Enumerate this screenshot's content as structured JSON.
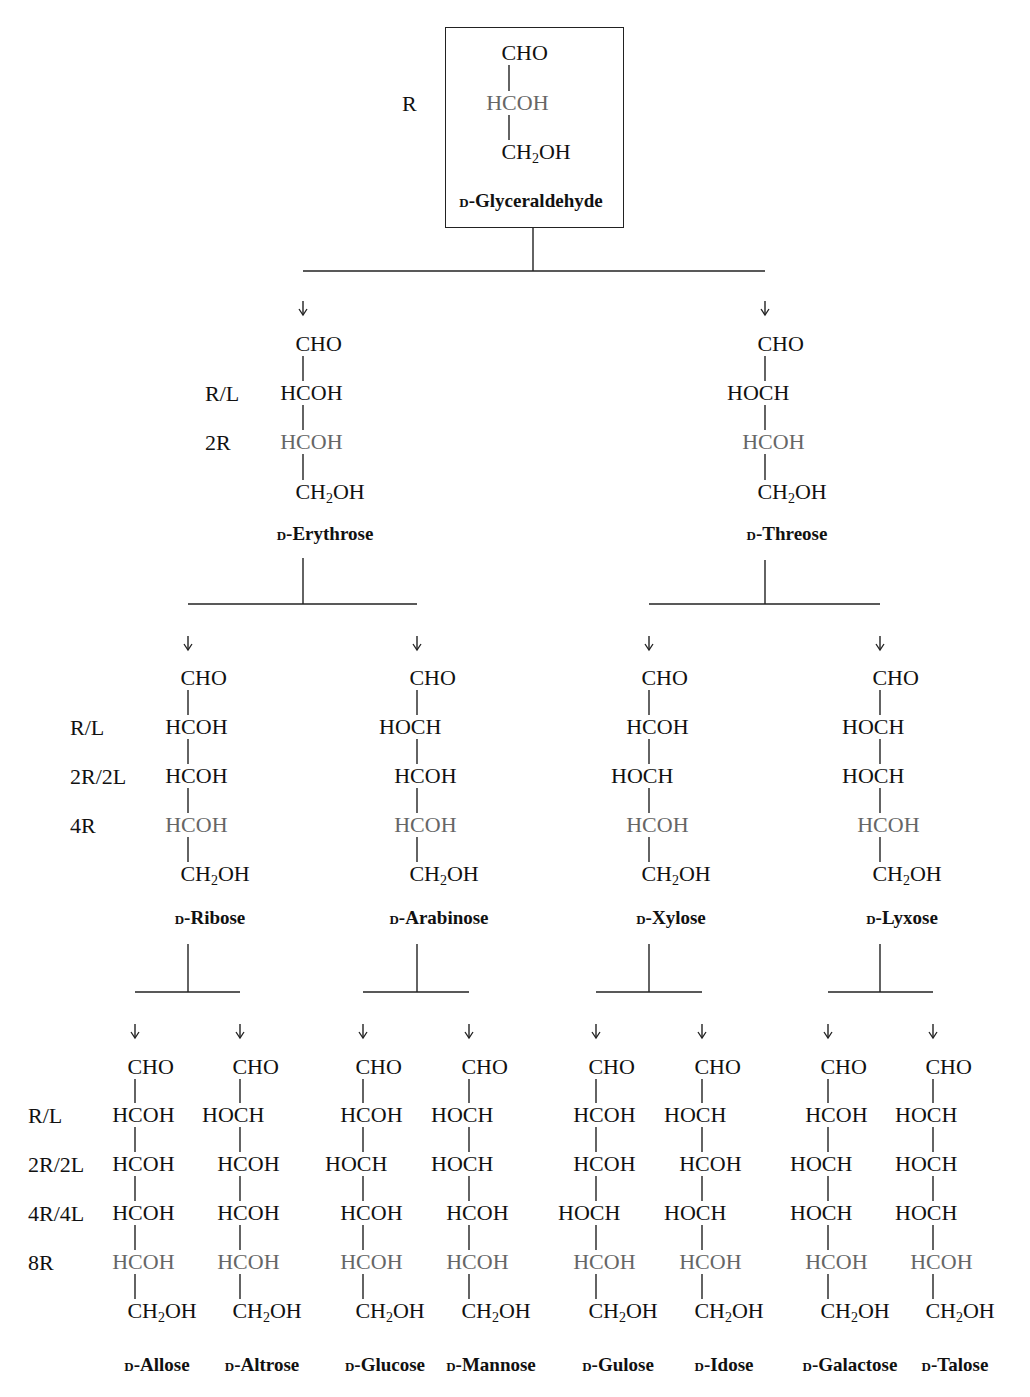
{
  "diagram": {
    "highlight_color": "#666666",
    "text_color": "#111111",
    "root": {
      "name": "Glyceraldehyde",
      "prefix": "D",
      "x": 509,
      "rows": [
        "CHO",
        "HCOH",
        "CH2OH"
      ],
      "highlight_row": 1,
      "labels": [
        "R"
      ]
    },
    "level_labels": {
      "level1": [
        "R"
      ],
      "level2": [
        "R/L",
        "2R"
      ],
      "level3": [
        "R/L",
        "2R/2L",
        "4R"
      ],
      "level4": [
        "R/L",
        "2R/2L",
        "4R/4L",
        "8R"
      ]
    },
    "level2": [
      {
        "name": "Erythrose",
        "prefix": "D",
        "x": 303,
        "rows": [
          "CHO",
          "HCOH",
          "HCOH",
          "CH2OH"
        ]
      },
      {
        "name": "Threose",
        "prefix": "D",
        "x": 765,
        "rows": [
          "CHO",
          "HOCH",
          "HCOH",
          "CH2OH"
        ]
      }
    ],
    "level3": [
      {
        "name": "Ribose",
        "prefix": "D",
        "x": 188,
        "rows": [
          "CHO",
          "HCOH",
          "HCOH",
          "HCOH",
          "CH2OH"
        ]
      },
      {
        "name": "Arabinose",
        "prefix": "D",
        "x": 417,
        "rows": [
          "CHO",
          "HOCH",
          "HCOH",
          "HCOH",
          "CH2OH"
        ]
      },
      {
        "name": "Xylose",
        "prefix": "D",
        "x": 649,
        "rows": [
          "CHO",
          "HCOH",
          "HOCH",
          "HCOH",
          "CH2OH"
        ]
      },
      {
        "name": "Lyxose",
        "prefix": "D",
        "x": 880,
        "rows": [
          "CHO",
          "HOCH",
          "HOCH",
          "HCOH",
          "CH2OH"
        ]
      }
    ],
    "level4": [
      {
        "name": "Allose",
        "prefix": "D",
        "x": 135,
        "rows": [
          "CHO",
          "HCOH",
          "HCOH",
          "HCOH",
          "HCOH",
          "CH2OH"
        ]
      },
      {
        "name": "Altrose",
        "prefix": "D",
        "x": 240,
        "rows": [
          "CHO",
          "HOCH",
          "HCOH",
          "HCOH",
          "HCOH",
          "CH2OH"
        ]
      },
      {
        "name": "Glucose",
        "prefix": "D",
        "x": 363,
        "rows": [
          "CHO",
          "HCOH",
          "HOCH",
          "HCOH",
          "HCOH",
          "CH2OH"
        ]
      },
      {
        "name": "Mannose",
        "prefix": "D",
        "x": 469,
        "rows": [
          "CHO",
          "HOCH",
          "HOCH",
          "HCOH",
          "HCOH",
          "CH2OH"
        ]
      },
      {
        "name": "Gulose",
        "prefix": "D",
        "x": 596,
        "rows": [
          "CHO",
          "HCOH",
          "HCOH",
          "HOCH",
          "HCOH",
          "CH2OH"
        ]
      },
      {
        "name": "Idose",
        "prefix": "D",
        "x": 702,
        "rows": [
          "CHO",
          "HOCH",
          "HCOH",
          "HOCH",
          "HCOH",
          "CH2OH"
        ]
      },
      {
        "name": "Galactose",
        "prefix": "D",
        "x": 828,
        "rows": [
          "CHO",
          "HCOH",
          "HOCH",
          "HOCH",
          "HCOH",
          "CH2OH"
        ]
      },
      {
        "name": "Talose",
        "prefix": "D",
        "x": 933,
        "rows": [
          "CHO",
          "HOCH",
          "HOCH",
          "HOCH",
          "HCOH",
          "CH2OH"
        ]
      }
    ]
  }
}
